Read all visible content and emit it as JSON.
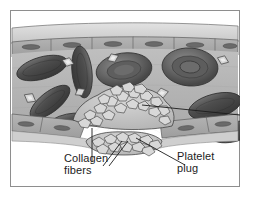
{
  "figure": {
    "type": "biology-illustration",
    "style": "grayscale line-and-wash textbook art",
    "frame": {
      "border_color": "#8e8e8e",
      "background": "#ffffff"
    }
  },
  "labels": {
    "collagen": {
      "text": "Collagen\nfibers",
      "leader": "vertical-line-to-fiber-bundle"
    },
    "platelet": {
      "text": "Platelet\nplug",
      "leader": "diagonal-line-to-plug-mass"
    },
    "right_callout": {
      "text": "",
      "leader": "horizontal-line-exiting-frame-right"
    }
  },
  "structures": [
    {
      "name": "vessel-wall-upper",
      "description": "endothelial cell layer with nuclei",
      "fill": "#a9a9a9"
    },
    {
      "name": "vessel-wall-lower",
      "description": "endothelial cell layer, ruptured at center",
      "fill": "#a9a9a9"
    },
    {
      "name": "vessel-lumen",
      "description": "plasma-filled interior",
      "fill": "#b8b8b8"
    },
    {
      "name": "red-blood-cells",
      "description": "erythrocytes, biconcave discs",
      "count": 9,
      "fill": "#555555"
    },
    {
      "name": "platelets-free",
      "description": "small diamond-shaped platelets in plasma",
      "count": 6,
      "fill": "#cfcfcf"
    },
    {
      "name": "platelet-plug",
      "description": "aggregated platelet mass sealing the break",
      "fill": "#c4c4c4"
    },
    {
      "name": "collagen-fibers",
      "description": "pale fibrous strands radiating from the wound",
      "fill": "#f2f2f2"
    }
  ],
  "colors": {
    "ink": "#1c1c1c",
    "wall": "#a9a9a9",
    "wall_top_band": "#d2d2d2",
    "lumen": "#b8b8b8",
    "rbc_dark": "#4a4a4a",
    "rbc_mid": "#6d6d6d",
    "rbc_light": "#8a8a8a",
    "plug": "#c4c4c4",
    "fiber": "#f4f4f4",
    "outline": "#3a3a3a"
  }
}
